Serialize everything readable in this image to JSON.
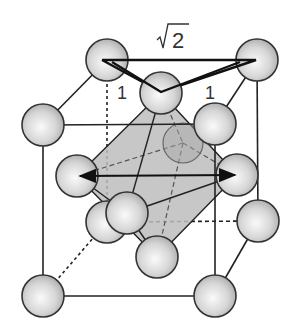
{
  "figure": {
    "labels": {
      "diagonal": "2",
      "diagonal_radical": "√",
      "edge_left": "1",
      "edge_right": "1"
    },
    "colors": {
      "sphere_fill": "#d9d9d9",
      "sphere_stroke": "#333333",
      "octahedron_fill": "#bdbdbd",
      "line": "#222222"
    },
    "atoms": [
      {
        "id": "top-back-left",
        "cx": 107,
        "cy": 60
      },
      {
        "id": "top-back-right",
        "cx": 257,
        "cy": 60
      },
      {
        "id": "top-face-center",
        "cx": 161,
        "cy": 93
      },
      {
        "id": "top-front-left",
        "cx": 43,
        "cy": 125
      },
      {
        "id": "top-front-right",
        "cx": 215,
        "cy": 124
      },
      {
        "id": "left-face-center",
        "cx": 77,
        "cy": 176
      },
      {
        "id": "right-face-center",
        "cx": 237,
        "cy": 175
      },
      {
        "id": "back-bottom-left",
        "cx": 107,
        "cy": 222
      },
      {
        "id": "front-face-center",
        "cx": 127,
        "cy": 213
      },
      {
        "id": "right-back-bottom",
        "cx": 258,
        "cy": 221
      },
      {
        "id": "bottom-face-center",
        "cx": 157,
        "cy": 257
      },
      {
        "id": "bottom-front-left",
        "cx": 43,
        "cy": 296
      },
      {
        "id": "bottom-front-right",
        "cx": 215,
        "cy": 296
      }
    ]
  }
}
